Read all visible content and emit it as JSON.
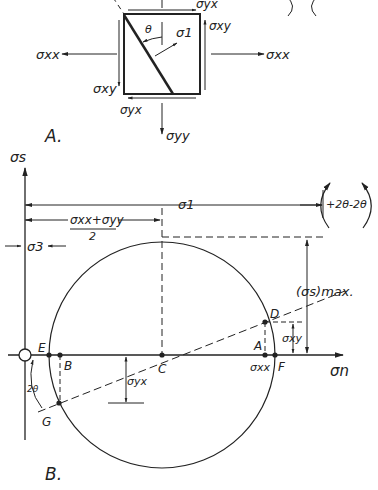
{
  "panel_a": {
    "label": "A.",
    "stress_labels": {
      "sxx_left": "σxx",
      "sxx_right": "σxx",
      "syy": "σyy",
      "syx_top": "σyx",
      "syx_bottom": "σyx",
      "sxy_right": "σxy",
      "sxy_left": "σxy",
      "theta": "θ",
      "s1": "σ1"
    }
  },
  "panel_b": {
    "label": "B.",
    "axis_labels": {
      "vertical": "σs",
      "horizontal": "σn"
    },
    "dimensions": {
      "s1": "σ1",
      "mean_num": "σxx+σyy",
      "mean_den": "2",
      "s3": "σ3",
      "smax": "(σs)max.",
      "sxy": "σxy",
      "syx": "σyx",
      "sxx": "σxx",
      "two_theta": "2θ"
    },
    "rotation_legend": {
      "pos": "+2θ",
      "neg": "-2θ"
    },
    "points": {
      "A": "A",
      "B": "B",
      "C": "C",
      "D": "D",
      "E": "E",
      "F": "F",
      "G": "G"
    }
  },
  "colors": {
    "ink": "#222222",
    "background": "#ffffff"
  }
}
